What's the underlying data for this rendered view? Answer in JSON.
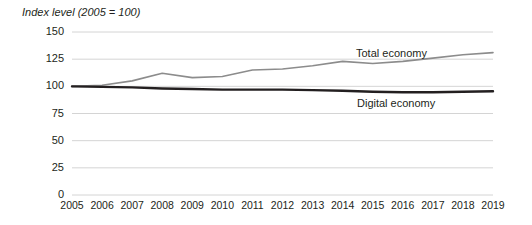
{
  "figure": {
    "axis_title": "Index level (2005 = 100)",
    "background_color": "#ffffff",
    "width": 532,
    "height": 225
  },
  "chart_data": {
    "type": "line",
    "title": "Index level (2005 = 100)",
    "xlabel": "",
    "ylabel": "Index level (2005 = 100)",
    "x": [
      2005,
      2006,
      2007,
      2008,
      2009,
      2010,
      2011,
      2012,
      2013,
      2014,
      2015,
      2016,
      2017,
      2018,
      2019
    ],
    "xtick_labels": [
      "2005",
      "2006",
      "2007",
      "2008",
      "2009",
      "2010",
      "2011",
      "2012",
      "2013",
      "2014",
      "2015",
      "2016",
      "2017",
      "2018",
      "2019"
    ],
    "ytick_labels": [
      "0",
      "25",
      "50",
      "75",
      "100",
      "125",
      "150"
    ],
    "yticks": [
      0,
      25,
      50,
      75,
      100,
      125,
      150
    ],
    "ylim": [
      0,
      150
    ],
    "xlim": [
      2005,
      2019
    ],
    "grid": "horizontal",
    "legend_position": "inline-annotation",
    "series": [
      {
        "name": "Total economy",
        "color": "#8c8c8c",
        "line_width": 1.6,
        "values": [
          100,
          101,
          105,
          112,
          108,
          109,
          115,
          116,
          119,
          123,
          121,
          123,
          126,
          129,
          131
        ],
        "label_text": "Total economy"
      },
      {
        "name": "Digital economy",
        "color": "#231f20",
        "line_width": 2.4,
        "values": [
          100,
          99.5,
          99,
          98,
          97.5,
          97,
          97,
          97,
          96.5,
          96,
          95,
          94.5,
          94.5,
          95,
          95.5
        ],
        "label_text": "Digital economy"
      }
    ]
  }
}
